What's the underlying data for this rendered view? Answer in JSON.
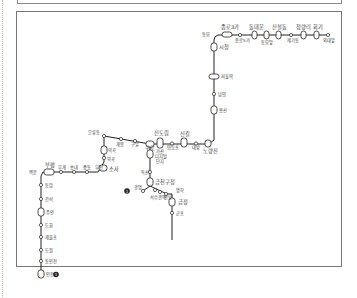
{
  "map": {
    "title": "",
    "line_color": "#222222",
    "stations_top": [
      {
        "name": "동묘앞",
        "x": 205,
        "y": 36
      },
      {
        "name": "종로3가",
        "x": 225,
        "y": 28
      },
      {
        "name": "종로5가",
        "x": 240,
        "y": 38
      },
      {
        "name": "동대문",
        "x": 254,
        "y": 28
      },
      {
        "name": "동묘앞",
        "x": 266,
        "y": 37
      },
      {
        "name": "신설동",
        "x": 278,
        "y": 28
      },
      {
        "name": "제기동",
        "x": 291,
        "y": 38
      },
      {
        "name": "청량리",
        "x": 303,
        "y": 28
      },
      {
        "name": "회기",
        "x": 316,
        "y": 28
      },
      {
        "name": "외대앞",
        "x": 328,
        "y": 38
      }
    ],
    "stations_vertical": [
      {
        "name": "시청",
        "x": 217,
        "y": 47
      },
      {
        "name": "서울역",
        "x": 217,
        "y": 77
      },
      {
        "name": "남영",
        "x": 217,
        "y": 94
      },
      {
        "name": "용산",
        "x": 217,
        "y": 110
      },
      {
        "name": "노량진",
        "x": 217,
        "y": 142
      }
    ],
    "stations_middle": [
      {
        "name": "오류동",
        "x": 101,
        "y": 136
      },
      {
        "name": "개봉",
        "x": 120,
        "y": 143
      },
      {
        "name": "구일",
        "x": 137,
        "y": 143
      },
      {
        "name": "구로",
        "x": 149,
        "y": 145
      },
      {
        "name": "신도림",
        "x": 164,
        "y": 133
      },
      {
        "name": "영등포",
        "x": 174,
        "y": 143
      },
      {
        "name": "신길",
        "x": 183,
        "y": 133
      },
      {
        "name": "대방",
        "x": 197,
        "y": 143
      },
      {
        "name": "역곡",
        "x": 113,
        "y": 150
      },
      {
        "name": "소사",
        "x": 113,
        "y": 163
      },
      {
        "name": "부천",
        "x": 108,
        "y": 172
      }
    ],
    "stations_west": [
      {
        "name": "부평",
        "x": 48,
        "y": 168
      },
      {
        "name": "백운",
        "x": 38,
        "y": 174
      },
      {
        "name": "부개",
        "x": 62,
        "y": 174
      },
      {
        "name": "송내",
        "x": 75,
        "y": 174
      },
      {
        "name": "중동",
        "x": 88,
        "y": 174
      },
      {
        "name": "부천",
        "x": 101,
        "y": 174
      },
      {
        "name": "동암",
        "x": 41,
        "y": 185
      },
      {
        "name": "간석",
        "x": 41,
        "y": 198
      },
      {
        "name": "주안",
        "x": 41,
        "y": 211
      },
      {
        "name": "도화",
        "x": 41,
        "y": 224
      },
      {
        "name": "제물포",
        "x": 41,
        "y": 237
      },
      {
        "name": "도원",
        "x": 41,
        "y": 250
      },
      {
        "name": "동인천",
        "x": 41,
        "y": 262
      },
      {
        "name": "인천",
        "x": 41,
        "y": 275
      }
    ],
    "stations_south": [
      {
        "name": "가산디지털단지",
        "x": 151,
        "y": 158
      },
      {
        "name": "독산",
        "x": 150,
        "y": 172
      },
      {
        "name": "금천구청",
        "x": 151,
        "y": 181
      },
      {
        "name": "광명",
        "x": 141,
        "y": 189
      },
      {
        "name": "석수",
        "x": 147,
        "y": 196
      },
      {
        "name": "관악",
        "x": 155,
        "y": 196
      },
      {
        "name": "안양",
        "x": 165,
        "y": 196
      },
      {
        "name": "명학",
        "x": 174,
        "y": 190
      },
      {
        "name": "금정",
        "x": 175,
        "y": 202
      },
      {
        "name": "군포",
        "x": 174,
        "y": 213
      }
    ],
    "terminus_markers": [
      {
        "label": "1",
        "x": 52,
        "y": 275
      },
      {
        "label": "1",
        "x": 126,
        "y": 191
      }
    ]
  }
}
